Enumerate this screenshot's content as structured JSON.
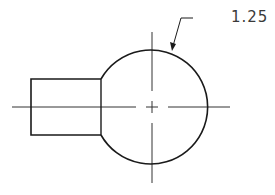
{
  "drawing": {
    "type": "technical-drawing",
    "dimension_label": "1.25",
    "stroke_color": "#1a1a1a",
    "centerline_color": "#333333",
    "shapes": {
      "circle": {
        "cx": 152,
        "cy": 107,
        "r": 57
      },
      "rectangle": {
        "x": 31,
        "y": 79,
        "width": 70,
        "height": 56
      },
      "leader": {
        "from": [
          193,
          18
        ],
        "elbow": [
          181,
          18
        ],
        "to": [
          172,
          50
        ]
      }
    }
  }
}
